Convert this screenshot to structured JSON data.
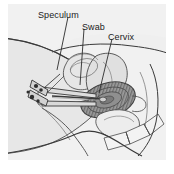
{
  "figure": {
    "view": "sagittal cross-section of the female pelvis",
    "frame": {
      "background_color": "#f1f1f1",
      "outer_margin_color": "#ffffff",
      "line_color": "#3a3a3a"
    },
    "labels": [
      {
        "id": "speculum",
        "text": "Speculum",
        "x": 30,
        "y": 6,
        "leader_from": [
          68,
          17
        ],
        "leader_to": [
          57,
          70
        ]
      },
      {
        "id": "swab",
        "text": "Swab",
        "x": 74,
        "y": 18,
        "leader_from": [
          84,
          29
        ],
        "leader_to": [
          80,
          85
        ]
      },
      {
        "id": "cervix",
        "text": "Cervix",
        "x": 100,
        "y": 28,
        "leader_from": [
          112,
          39
        ],
        "leader_to": [
          99,
          93
        ]
      }
    ],
    "structures": [
      {
        "name": "thigh",
        "fill": "#e7e7e7"
      },
      {
        "name": "abdominal-wall",
        "fill": "#ededed"
      },
      {
        "name": "bladder",
        "fill": "#e4e4e4"
      },
      {
        "name": "uterus",
        "fill": "#e0e0e0"
      },
      {
        "name": "cervix",
        "fill": "#8c8c8c"
      },
      {
        "name": "vagina",
        "fill": "#eaeaea"
      },
      {
        "name": "rectum",
        "fill": "#ececec"
      },
      {
        "name": "sacrum-vertebrae",
        "fill": "#f2f2f2"
      },
      {
        "name": "speculum-instrument",
        "fill": "#dcdcdc"
      },
      {
        "name": "swab-stick",
        "fill": "#d8d8d8"
      }
    ],
    "palette": {
      "ink": "#3a3a3a",
      "ink_light": "#6e6e6e",
      "cervix_dark": "#6f6f6f",
      "cervix_mid": "#9a9a9a",
      "tissue_light": "#e7e7e7",
      "background": "#f1f1f1"
    }
  }
}
